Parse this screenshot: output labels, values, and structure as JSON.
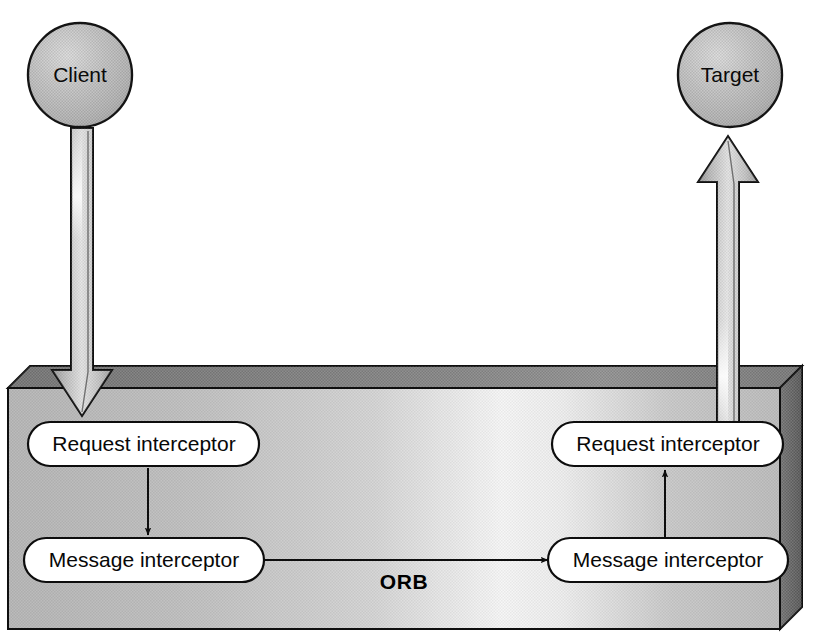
{
  "diagram": {
    "background_color": "#ffffff",
    "nodes": {
      "client": {
        "label": "Client",
        "shape": "circle",
        "cx": 80,
        "cy": 75,
        "r": 52,
        "fill": "#b4b4b4",
        "stroke": "#141414"
      },
      "target": {
        "label": "Target",
        "shape": "circle",
        "cx": 730,
        "cy": 75,
        "r": 52,
        "fill": "#b4b4b4",
        "stroke": "#141414"
      }
    },
    "container": {
      "label": "ORB",
      "label_x": 404,
      "label_y": 582,
      "front_fill_left": "#b8b8b8",
      "front_fill_mid": "#f2f2f2",
      "front_fill_right": "#c0c0c0",
      "top_fill": "#6e6e6e",
      "side_fill": "#545454",
      "stroke": "#101010",
      "x": 8,
      "y": 366,
      "width": 772,
      "height": 263,
      "depth": 22
    },
    "pills": [
      {
        "id": "left-request-interceptor",
        "label": "Request interceptor",
        "cx": 144,
        "cy": 444,
        "width": 231,
        "height": 44,
        "fill": "#ffffff",
        "stroke": "#0d0d0d"
      },
      {
        "id": "left-message-interceptor",
        "label": "Message interceptor",
        "cx": 144,
        "cy": 560,
        "width": 240,
        "height": 44,
        "fill": "#ffffff",
        "stroke": "#0d0d0d"
      },
      {
        "id": "right-request-interceptor",
        "label": "Request interceptor",
        "cx": 668,
        "cy": 444,
        "width": 231,
        "height": 44,
        "fill": "#ffffff",
        "stroke": "#0d0d0d"
      },
      {
        "id": "right-message-interceptor",
        "label": "Message interceptor",
        "cx": 668,
        "cy": 560,
        "width": 240,
        "height": 44,
        "fill": "#ffffff",
        "stroke": "#0d0d0d"
      }
    ],
    "block_arrows": [
      {
        "id": "client-to-orb-arrow",
        "direction": "down",
        "from": "client",
        "to": "left-request-interceptor",
        "x_center": 82,
        "y_start": 128,
        "y_end": 416,
        "shaft_width": 22,
        "head_width": 60,
        "head_height": 46,
        "fill": "#c8c8c8",
        "stroke": "#101010"
      },
      {
        "id": "orb-to-target-arrow",
        "direction": "up",
        "from": "right-request-interceptor",
        "to": "target",
        "x_center": 728,
        "y_start": 432,
        "y_end": 136,
        "shaft_width": 22,
        "head_width": 60,
        "head_height": 46,
        "fill": "#c8c8c8",
        "stroke": "#101010"
      }
    ],
    "thin_arrows": [
      {
        "id": "left-request-to-message-arrow",
        "direction": "down",
        "from": "left-request-interceptor",
        "to": "left-message-interceptor",
        "x1": 148,
        "y1": 468,
        "x2": 148,
        "y2": 535,
        "stroke": "#0d0d0d"
      },
      {
        "id": "left-message-to-right-message-arrow",
        "direction": "right",
        "from": "left-message-interceptor",
        "to": "right-message-interceptor",
        "x1": 265,
        "y1": 560,
        "x2": 546,
        "y2": 560,
        "stroke": "#0d0d0d"
      },
      {
        "id": "right-message-to-request-arrow",
        "direction": "up",
        "from": "right-message-interceptor",
        "to": "right-request-interceptor",
        "x1": 665,
        "y1": 536,
        "x2": 665,
        "y2": 470,
        "stroke": "#0d0d0d"
      }
    ]
  }
}
